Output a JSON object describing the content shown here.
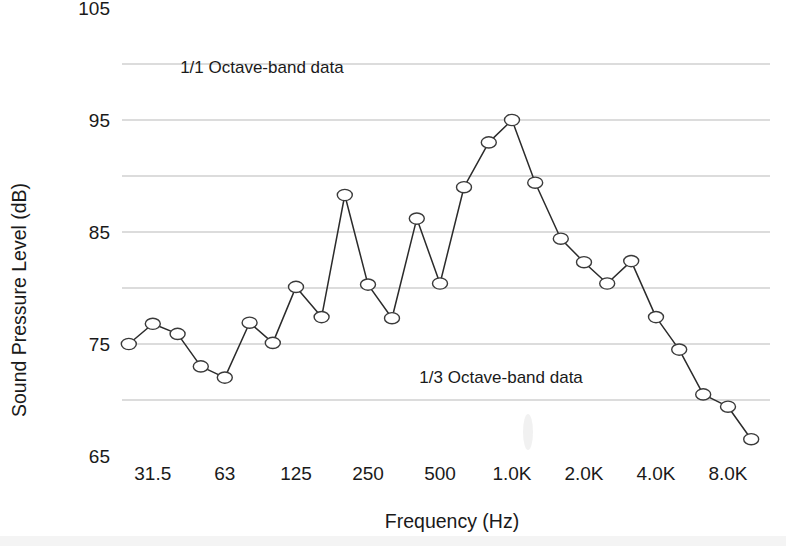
{
  "chart_data": {
    "type": "line",
    "title": "",
    "xlabel": "Frequency (Hz)",
    "ylabel": "Sound Pressure Level (dB)",
    "ylim": [
      65,
      105
    ],
    "ytick_labels": [
      "105",
      "95",
      "85",
      "75",
      "65"
    ],
    "yticks": [
      105,
      95,
      85,
      75,
      65
    ],
    "gridlines": [
      100,
      95,
      90,
      85,
      80,
      75,
      70
    ],
    "grid": true,
    "legend": "none",
    "xtick_labels": [
      "31.5",
      "63",
      "125",
      "250",
      "500",
      "1.0K",
      "2.0K",
      "4.0K",
      "8.0K"
    ],
    "xticks_hz": [
      31.5,
      63,
      125,
      250,
      500,
      1000,
      2000,
      4000,
      8000
    ],
    "xscale": "log",
    "annotations": [
      {
        "text": "1/1 Octave-band data",
        "x_hz": 90,
        "y_db": 99.2
      },
      {
        "text": "1/3 Octave-band data",
        "x_hz": 900,
        "y_db": 71.5
      }
    ],
    "series": [
      {
        "name": "1/3 Octave-band data",
        "marker": "open-circle",
        "x_hz": [
          25,
          31.5,
          40,
          50,
          63,
          80,
          100,
          125,
          160,
          200,
          250,
          315,
          400,
          500,
          630,
          800,
          1000,
          1250,
          1600,
          2000,
          2500,
          3150,
          4000,
          5000,
          6300,
          8000,
          10000
        ],
        "values": [
          75.0,
          76.8,
          75.9,
          73.0,
          72.0,
          76.9,
          75.1,
          80.1,
          77.4,
          88.3,
          80.3,
          77.3,
          86.2,
          80.4,
          89.0,
          93.0,
          95.0,
          89.4,
          84.4,
          82.3,
          80.4,
          82.4,
          77.4,
          74.5,
          70.5,
          69.4,
          66.5
        ]
      }
    ]
  },
  "colors": {
    "line": "#2b2b2b",
    "marker_stroke": "#3a3a3a",
    "marker_fill": "#ffffff",
    "grid": "#b9b9b9",
    "text": "#1a1a1a",
    "background": "#ffffff"
  }
}
